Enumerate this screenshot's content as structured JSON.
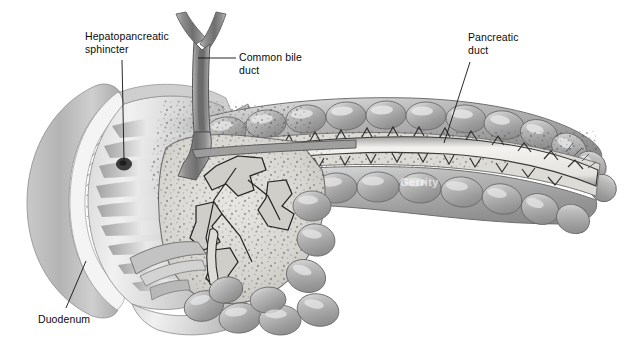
{
  "figure": {
    "width": 638,
    "height": 353,
    "background_color": "#ffffff",
    "style": "grayscale medical illustration, cutaway view"
  },
  "labels": {
    "hepatopancreatic_sphincter": "Hepatopancreatic\nsphincter",
    "common_bile_duct": "Common bile\nduct",
    "pancreatic_duct": "Pancreatic\nduct",
    "duodenum": "Duodenum"
  },
  "watermark": {
    "text": "Gerrity",
    "color": "#ffffff"
  },
  "leader_lines": {
    "hepatopancreatic_sphincter": {
      "from_x": 122,
      "from_y": 60,
      "to_x": 124,
      "to_y": 163
    },
    "common_bile_duct": {
      "from_x": 236,
      "from_y": 58,
      "to_x": 196,
      "to_y": 58
    },
    "pancreatic_duct": {
      "from_x": 470,
      "from_y": 62,
      "to_x": 443,
      "to_y": 142
    },
    "duodenum": {
      "from_x": 66,
      "from_y": 309,
      "to_x": 85,
      "to_y": 262
    }
  },
  "palette": {
    "outline": "#2d2d2d",
    "tissue_mid": "#a6a6a6",
    "tissue_light": "#d2d2d2",
    "tissue_highlight": "#eeeeee",
    "tissue_dark": "#7b7b7b",
    "duct_lumen": "#f0efec",
    "duct_wall": "#8e8e8e",
    "stipple": "#4a4a4a",
    "papilla": "#3a3a3a",
    "label_text": "#0b0b0b"
  },
  "structures": [
    {
      "name": "duodenum",
      "description": "C-shaped cut-open duodenum at left showing circular folds and scalloped mucosal fringe"
    },
    {
      "name": "common-bile-duct",
      "description": "Y-forked duct descending from top center into pancreas head"
    },
    {
      "name": "hepatopancreatic-sphincter",
      "description": "dark papilla opening on inner duodenal wall"
    },
    {
      "name": "pancreas-head",
      "description": "stippled glandular head with branching accessory ducts"
    },
    {
      "name": "pancreas-body-tail",
      "description": "lobulated body and tail curving up to the right"
    },
    {
      "name": "pancreatic-duct",
      "description": "main duct with sawtooth side branches running the length of the gland"
    }
  ]
}
